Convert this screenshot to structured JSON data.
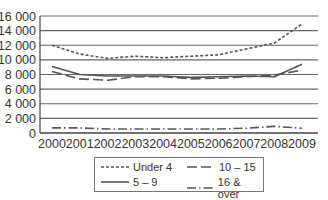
{
  "chart_data": {
    "type": "line",
    "title": "",
    "xlabel": "",
    "ylabel": "",
    "x": [
      "2000",
      "2001",
      "2002",
      "2003",
      "2004",
      "2005",
      "2006",
      "2007",
      "2008",
      "2009"
    ],
    "ylim": [
      0,
      16000
    ],
    "yticks": [
      "0",
      "2000",
      "4000",
      "6000",
      "8000",
      "10 000",
      "12 000",
      "14 000",
      "16 000"
    ],
    "ytick_values": [
      0,
      2000,
      4000,
      6000,
      8000,
      10000,
      12000,
      14000,
      16000
    ],
    "grid": true,
    "legend_position": "bottom",
    "series": [
      {
        "name": "Under 4",
        "style": "dotted-dash",
        "color": "#555555",
        "values": [
          12000,
          10800,
          10200,
          10500,
          10300,
          10500,
          10700,
          11500,
          12300,
          14900
        ]
      },
      {
        "name": "5 – 9",
        "style": "solid",
        "color": "#555555",
        "values": [
          9100,
          8000,
          7800,
          7800,
          7800,
          7600,
          7700,
          7800,
          7700,
          9400
        ]
      },
      {
        "name": "10 – 15",
        "style": "long-dash",
        "color": "#555555",
        "values": [
          8400,
          7400,
          7200,
          7700,
          7700,
          7400,
          7500,
          7700,
          7900,
          8600
        ]
      },
      {
        "name": "16 & over",
        "style": "dash-dot",
        "color": "#555555",
        "values": [
          700,
          700,
          550,
          550,
          550,
          550,
          550,
          650,
          900,
          650
        ]
      }
    ]
  },
  "legend": {
    "items": [
      {
        "label": "Under 4"
      },
      {
        "label": "10 – 15"
      },
      {
        "label": "5 – 9"
      },
      {
        "label": "16 & over"
      }
    ]
  },
  "axis": {
    "y_labels": [
      "16 000",
      "14 000",
      "12 000",
      "10 000",
      "8 000",
      "6 000",
      "4 000",
      "2 000",
      "0"
    ],
    "x_labels": [
      "2000",
      "2001",
      "2002",
      "2003",
      "2004",
      "2005",
      "2006",
      "2007",
      "2008",
      "2009"
    ]
  }
}
